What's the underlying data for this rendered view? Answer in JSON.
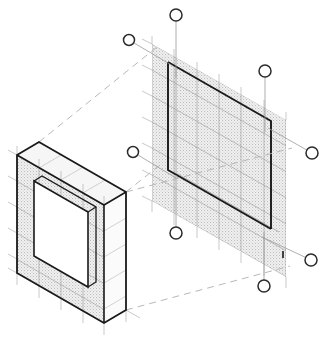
{
  "drawing": {
    "title": "Isometric wall panel assembly",
    "type": "isometric-technical-drawing",
    "width": 329,
    "height": 345,
    "background_color": "#ffffff"
  },
  "style": {
    "outline_color": "#1a1a1a",
    "grid_color": "#8c8c8c",
    "grid_light_color": "#b5b5b5",
    "hatch_color": "#c8c8c8",
    "hatch_fill": "#e8e8e8",
    "dashed_color": "#aaaaaa",
    "leader_color": "#909090",
    "balloon_stroke": "#2b2b2b",
    "balloon_fill": "#ffffff",
    "outline_width": "1.8",
    "thin_width": "0.7",
    "grid_width": "0.6"
  },
  "isometric": {
    "axis_x_label": "right-down-30deg",
    "axis_y_label": "left-down-30deg",
    "axis_z_label": "vertical",
    "grid_module_px": 20
  },
  "panels": [
    {
      "id": "left-panel",
      "name": "Left wall panel with opening",
      "kind": "solid-slab",
      "has_thickness": true,
      "thickness_px": 22,
      "face_hatched": true,
      "opening": {
        "name": "rectangular-opening",
        "outlined": true
      },
      "grid_columns": 5,
      "grid_rows": 5
    },
    {
      "id": "right-panel",
      "name": "Right wall panel reference plane",
      "kind": "hatched-plane",
      "has_thickness": false,
      "face_hatched": true,
      "opening": {
        "name": "rectangular-reveal",
        "outlined": true
      },
      "grid_columns": 6,
      "grid_rows": 6
    }
  ],
  "construction_lines": {
    "name": "projection-dashed-lines",
    "count": 4,
    "style": "dashed",
    "description": "Dashed projection lines linking left panel corners to right panel plane"
  },
  "balloons": [
    {
      "id": "balloon-1",
      "label": "",
      "cx": 176,
      "cy": 15,
      "r": 6,
      "leader_to_x": 176,
      "leader_to_y": 78,
      "leader_type": "vertical"
    },
    {
      "id": "balloon-2",
      "label": "",
      "cx": 129,
      "cy": 40,
      "r": 5.5,
      "leader_to_x": 173,
      "leader_to_y": 66,
      "leader_type": "diagonal"
    },
    {
      "id": "balloon-3",
      "label": "",
      "cx": 265,
      "cy": 71,
      "r": 6,
      "leader_to_x": 265,
      "leader_to_y": 132,
      "leader_type": "vertical"
    },
    {
      "id": "balloon-4",
      "label": "",
      "cx": 133,
      "cy": 152,
      "r": 5.5,
      "leader_to_x": 176,
      "leader_to_y": 178,
      "leader_type": "diagonal"
    },
    {
      "id": "balloon-5",
      "label": "",
      "cx": 312,
      "cy": 153,
      "r": 6,
      "leader_to_x": 268,
      "leader_to_y": 128,
      "leader_type": "diagonal"
    },
    {
      "id": "balloon-6",
      "label": "",
      "cx": 176,
      "cy": 233,
      "r": 6,
      "leader_to_x": 176,
      "leader_to_y": 175,
      "leader_type": "vertical"
    },
    {
      "id": "balloon-7",
      "label": "",
      "cx": 311,
      "cy": 260,
      "r": 6,
      "leader_to_x": 262,
      "leader_to_y": 237,
      "leader_type": "diagonal"
    },
    {
      "id": "balloon-8",
      "label": "",
      "cx": 264,
      "cy": 286,
      "r": 6,
      "leader_to_x": 264,
      "leader_to_y": 232,
      "leader_type": "vertical"
    }
  ],
  "tick_mark": {
    "name": "small-reference-tick",
    "x": 283,
    "y": 258,
    "length": 7
  }
}
